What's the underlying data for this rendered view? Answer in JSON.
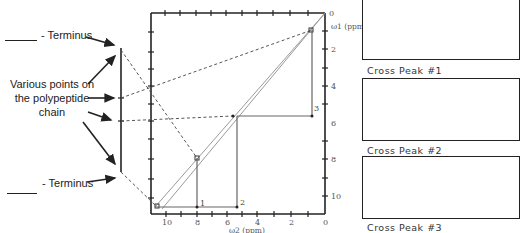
{
  "left_panel": {
    "top_terminus_label": "- Terminus",
    "bottom_terminus_label": "- Terminus",
    "various_points_line1": "Various points on",
    "various_points_line2": "the polypeptide",
    "various_points_line3": "chain"
  },
  "spectrum": {
    "y_axis_title": "ω1 (ppm)",
    "x_axis_title": "ω2 (ppm)",
    "y_ticks": [
      "0",
      "2",
      "4",
      "6",
      "8",
      "10"
    ],
    "x_ticks": [
      "10",
      "8",
      "6",
      "4",
      "2",
      "0"
    ],
    "cross_point_labels": [
      "1",
      "2",
      "3"
    ]
  },
  "cross_peaks": [
    {
      "label": "Cross Peak #1"
    },
    {
      "label": "Cross Peak #2"
    },
    {
      "label": "Cross Peak #3"
    }
  ],
  "colors": {
    "axis": "#222222",
    "diagonal": "#9a9a9a",
    "dashed": "#555555",
    "peak_line": "#666666"
  }
}
